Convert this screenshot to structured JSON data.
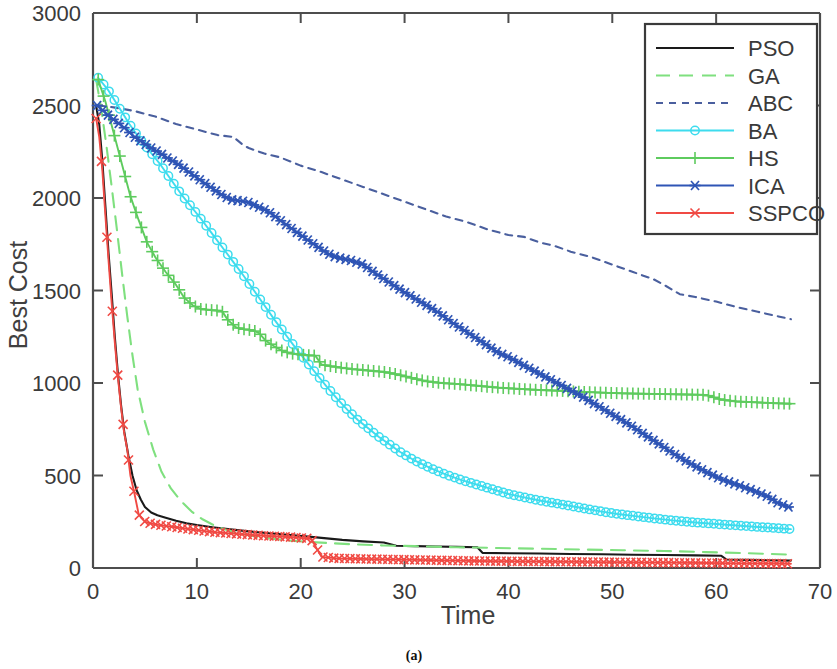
{
  "chart_data": {
    "type": "line",
    "title": "",
    "caption": "(a)",
    "xlabel": "Time",
    "ylabel": "Best Cost",
    "xlim": [
      0,
      70
    ],
    "ylim": [
      0,
      3000
    ],
    "xticks": [
      0,
      10,
      20,
      30,
      40,
      50,
      60,
      70
    ],
    "yticks": [
      0,
      500,
      1000,
      1500,
      2000,
      2500,
      3000
    ],
    "grid": false,
    "legend_position": "top-right",
    "series": [
      {
        "name": "PSO",
        "color": "#1a1a1a",
        "style": "solid",
        "marker": "none",
        "x": [
          0.3,
          0.6,
          0.9,
          1.2,
          1.5,
          1.8,
          2.1,
          2.4,
          2.7,
          3.0,
          3.4,
          3.8,
          4.2,
          4.6,
          5.0,
          5.6,
          6.2,
          7.0,
          8.0,
          9.0,
          10.0,
          11.5,
          13.0,
          15.0,
          17.0,
          19.0,
          21.0,
          22.5,
          24.0,
          26.0,
          28.0,
          29.2,
          31.0,
          33.0,
          35.0,
          37.0,
          37.5,
          40.0,
          43.0,
          46.0,
          49.0,
          52.0,
          55.0,
          58.0,
          60.5,
          61.0,
          63.0,
          65.0,
          67.2
        ],
        "y": [
          2500,
          2400,
          2200,
          1950,
          1700,
          1480,
          1250,
          1050,
          880,
          740,
          610,
          500,
          420,
          370,
          330,
          300,
          285,
          272,
          255,
          242,
          232,
          220,
          210,
          198,
          188,
          178,
          168,
          160,
          152,
          144,
          138,
          120,
          118,
          116,
          114,
          112,
          82,
          80,
          78,
          76,
          74,
          72,
          70,
          68,
          66,
          46,
          44,
          42,
          40
        ]
      },
      {
        "name": "GA",
        "color": "#7fe07f",
        "style": "dashed",
        "marker": "none",
        "x": [
          0.3,
          0.8,
          1.3,
          1.8,
          2.3,
          2.8,
          3.3,
          3.8,
          4.3,
          5.0,
          5.8,
          6.6,
          7.5,
          8.5,
          9.5,
          10.5,
          11.5,
          12.5,
          14.0,
          15.5,
          17.0,
          19.0,
          21.0,
          23.0,
          25.0,
          28.0,
          31.0,
          35.0,
          39.0,
          43.0,
          47.0,
          51.0,
          55.0,
          59.0,
          63.0,
          67.2
        ],
        "y": [
          2640,
          2480,
          2280,
          2060,
          1830,
          1590,
          1360,
          1150,
          965,
          790,
          640,
          520,
          430,
          360,
          305,
          265,
          235,
          212,
          188,
          172,
          160,
          148,
          140,
          134,
          128,
          122,
          118,
          112,
          108,
          104,
          100,
          96,
          92,
          86,
          80,
          72
        ]
      },
      {
        "name": "ABC",
        "color": "#4a5f9e",
        "style": "dotted",
        "marker": "none",
        "x": [
          0.5,
          2.0,
          4.0,
          6.0,
          8.0,
          10.0,
          12.0,
          13.5,
          14.5,
          15.0,
          16.5,
          18.0,
          20.0,
          22.0,
          24.0,
          26.0,
          28.0,
          30.0,
          32.0,
          34.0,
          36.0,
          38.0,
          40.0,
          41.5,
          43.0,
          44.5,
          46.0,
          48.0,
          50.0,
          52.0,
          54.0,
          55.0,
          56.5,
          58.0,
          60.0,
          62.0,
          64.0,
          66.0,
          67.2
        ],
        "y": [
          2500,
          2490,
          2470,
          2440,
          2400,
          2370,
          2340,
          2330,
          2285,
          2270,
          2240,
          2220,
          2175,
          2140,
          2100,
          2060,
          2020,
          1980,
          1940,
          1900,
          1870,
          1830,
          1800,
          1790,
          1760,
          1740,
          1710,
          1680,
          1640,
          1600,
          1560,
          1530,
          1480,
          1465,
          1440,
          1410,
          1385,
          1360,
          1345
        ]
      },
      {
        "name": "BA",
        "color": "#3ddcee",
        "style": "solid",
        "marker": "circle",
        "x": [
          0.5,
          1.5,
          2.5,
          3.5,
          4.5,
          5.5,
          6.5,
          7.5,
          8.5,
          9.5,
          10.5,
          11.5,
          12.5,
          13.5,
          14.5,
          15.5,
          16.5,
          17.5,
          18.5,
          19.5,
          20.5,
          21.5,
          22.5,
          23.5,
          24.5,
          25.5,
          26.5,
          27.5,
          28.5,
          29.5,
          31.0,
          32.5,
          34.0,
          35.5,
          37.0,
          38.5,
          40.0,
          41.5,
          43.0,
          44.5,
          46.0,
          47.5,
          49.0,
          50.5,
          52.0,
          54.0,
          56.0,
          58.0,
          60.0,
          62.0,
          64.0,
          66.0,
          67.2
        ],
        "y": [
          2650,
          2580,
          2490,
          2400,
          2320,
          2250,
          2180,
          2100,
          2020,
          1950,
          1880,
          1805,
          1730,
          1655,
          1580,
          1500,
          1420,
          1340,
          1265,
          1190,
          1120,
          1050,
          980,
          915,
          855,
          800,
          755,
          710,
          670,
          630,
          580,
          540,
          505,
          475,
          450,
          425,
          400,
          382,
          365,
          350,
          335,
          320,
          305,
          292,
          282,
          268,
          256,
          246,
          238,
          230,
          222,
          215,
          210
        ]
      },
      {
        "name": "HS",
        "color": "#5ecb5e",
        "style": "solid",
        "marker": "plus",
        "x": [
          0.5,
          1.2,
          2.0,
          2.8,
          3.6,
          4.4,
          5.2,
          6.0,
          7.0,
          8.0,
          8.8,
          9.6,
          10.4,
          11.2,
          11.8,
          12.4,
          13.0,
          13.8,
          14.6,
          15.4,
          16.0,
          16.6,
          17.4,
          18.2,
          19.0,
          19.8,
          20.6,
          21.4,
          22.0,
          23.0,
          24.0,
          25.0,
          26.0,
          27.0,
          28.0,
          29.0,
          30.5,
          32.0,
          33.5,
          35.0,
          37.0,
          39.0,
          41.0,
          43.0,
          45.0,
          47.0,
          49.0,
          51.0,
          53.0,
          55.0,
          57.0,
          59.0,
          60.5,
          62.0,
          64.0,
          66.0,
          67.2
        ],
        "y": [
          2640,
          2520,
          2350,
          2180,
          2010,
          1880,
          1760,
          1680,
          1600,
          1530,
          1460,
          1420,
          1400,
          1395,
          1392,
          1390,
          1340,
          1300,
          1290,
          1285,
          1270,
          1230,
          1200,
          1175,
          1160,
          1155,
          1150,
          1148,
          1100,
          1090,
          1082,
          1075,
          1070,
          1065,
          1060,
          1050,
          1030,
          1010,
          1000,
          995,
          985,
          975,
          968,
          962,
          958,
          952,
          948,
          944,
          942,
          940,
          938,
          936,
          910,
          900,
          895,
          890,
          888
        ]
      },
      {
        "name": "ICA",
        "color": "#2f55b5",
        "style": "solid",
        "marker": "asterisk",
        "x": [
          0.4,
          1.0,
          1.6,
          2.2,
          2.8,
          3.4,
          4.0,
          4.8,
          5.6,
          6.4,
          7.2,
          8.0,
          9.0,
          10.0,
          11.0,
          11.8,
          12.6,
          13.4,
          14.0,
          14.8,
          15.6,
          16.4,
          17.2,
          18.0,
          19.0,
          20.0,
          21.0,
          21.8,
          22.6,
          23.4,
          24.2,
          25.0,
          26.0,
          27.0,
          28.5,
          30.0,
          31.5,
          33.0,
          34.5,
          36.0,
          37.5,
          39.0,
          40.0,
          41.0,
          42.5,
          44.0,
          45.5,
          47.0,
          48.5,
          50.0,
          51.5,
          53.0,
          54.5,
          56.0,
          57.5,
          59.0,
          60.5,
          62.0,
          63.5,
          65.0,
          66.0,
          67.2
        ],
        "y": [
          2500,
          2470,
          2440,
          2415,
          2390,
          2360,
          2330,
          2300,
          2270,
          2245,
          2215,
          2190,
          2150,
          2110,
          2070,
          2040,
          2010,
          1990,
          1985,
          1980,
          1960,
          1940,
          1915,
          1880,
          1840,
          1800,
          1760,
          1730,
          1700,
          1680,
          1670,
          1660,
          1640,
          1600,
          1545,
          1490,
          1440,
          1390,
          1330,
          1275,
          1220,
          1165,
          1140,
          1110,
          1065,
          1020,
          975,
          930,
          880,
          830,
          780,
          725,
          670,
          615,
          565,
          520,
          480,
          450,
          420,
          385,
          350,
          325
        ]
      },
      {
        "name": "SSPCO",
        "color": "#f04a44",
        "style": "solid",
        "marker": "x",
        "x": [
          0.3,
          0.6,
          0.9,
          1.2,
          1.5,
          1.8,
          2.1,
          2.4,
          2.7,
          3.0,
          3.3,
          3.6,
          4.0,
          4.4,
          5.0,
          5.6,
          6.4,
          7.2,
          8.0,
          9.0,
          10.0,
          11.0,
          12.0,
          13.5,
          15.0,
          16.5,
          18.0,
          19.5,
          21.0,
          22.0,
          23.5,
          25.0,
          27.0,
          29.0,
          31.0,
          33.0,
          35.0,
          37.0,
          39.0,
          41.0,
          43.0,
          45.0,
          47.0,
          49.0,
          51.0,
          53.0,
          55.0,
          57.0,
          59.0,
          61.0,
          63.0,
          65.0,
          67.2
        ],
        "y": [
          2430,
          2330,
          2150,
          1900,
          1660,
          1430,
          1220,
          1030,
          870,
          730,
          640,
          500,
          400,
          290,
          250,
          240,
          232,
          226,
          220,
          212,
          205,
          198,
          192,
          186,
          180,
          174,
          170,
          165,
          158,
          60,
          52,
          50,
          48,
          46,
          44,
          42,
          40,
          38,
          37,
          36,
          35,
          34,
          33,
          32,
          31,
          30,
          29,
          28,
          27,
          26,
          25,
          24,
          23
        ]
      }
    ]
  }
}
